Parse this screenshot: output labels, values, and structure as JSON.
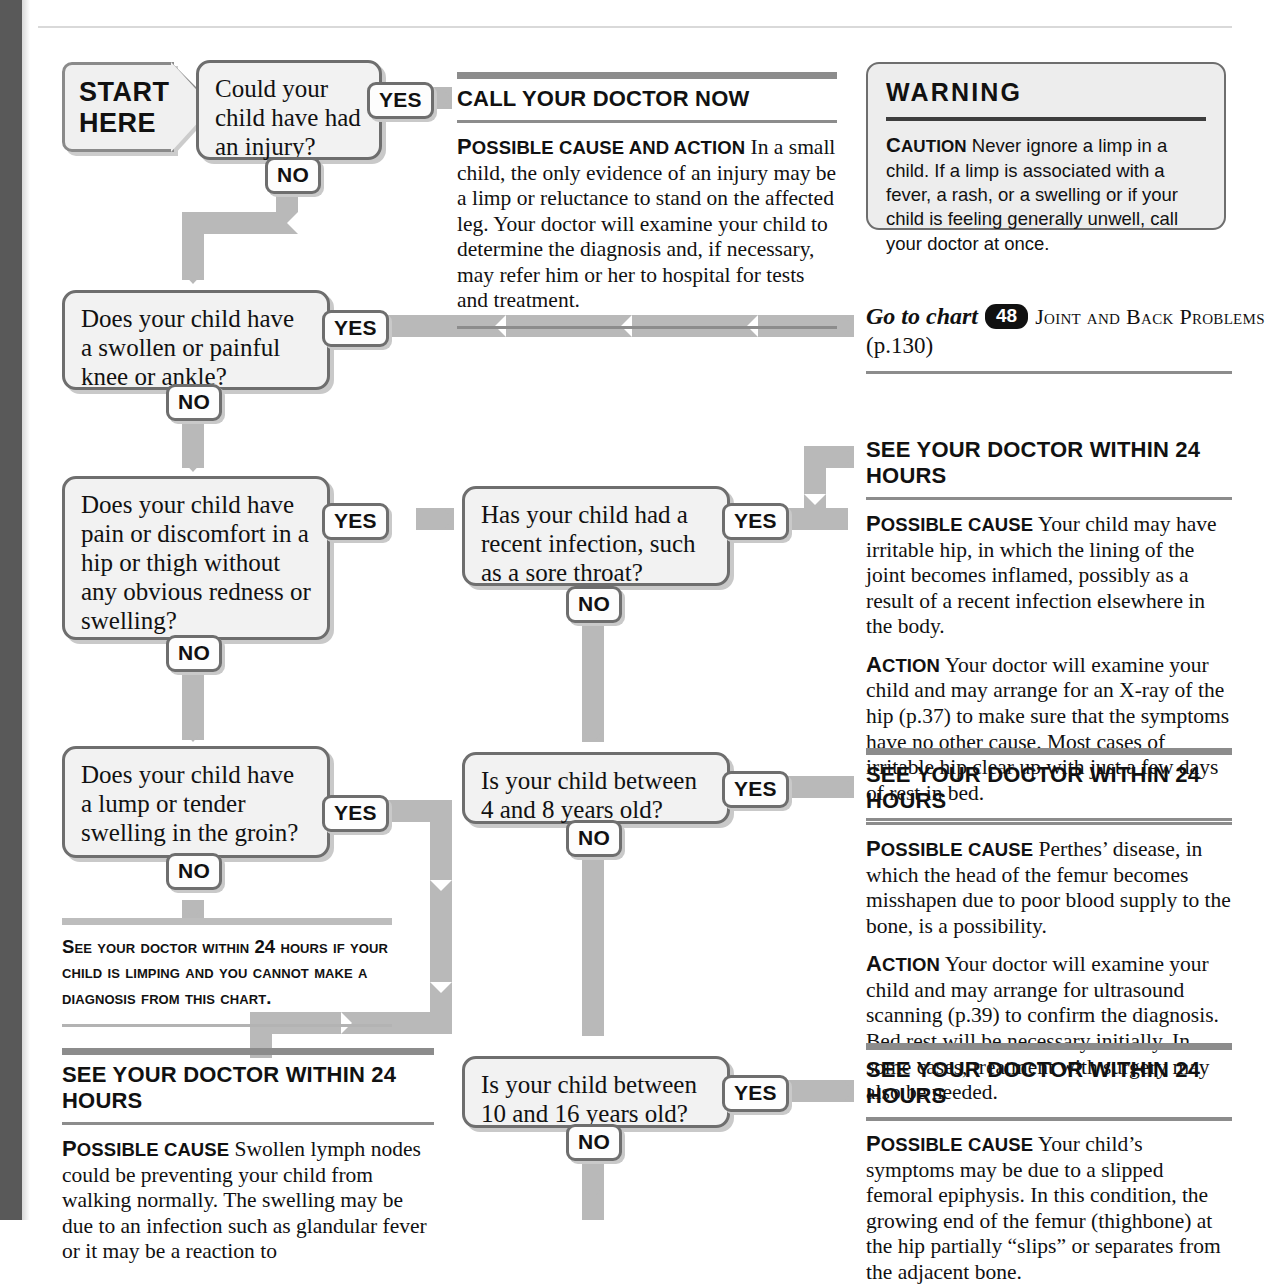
{
  "page": {
    "cut_text": "",
    "start_line1": "START",
    "start_line2": "HERE"
  },
  "labels": {
    "yes": "YES",
    "no": "NO"
  },
  "questions": [
    {
      "id": "injury",
      "text": "Could your child have had an injury?"
    },
    {
      "id": "knee",
      "text": "Does your child have a swollen or painful knee or ankle?"
    },
    {
      "id": "hip",
      "text": "Does your child have pain or discomfort in a hip or thigh without any obvious redness or swelling?"
    },
    {
      "id": "infection",
      "text": "Has your child had a recent infection, such as a sore throat?"
    },
    {
      "id": "groin",
      "text": "Does your child have a lump or tender swelling in the groin?"
    },
    {
      "id": "age4to8",
      "text": "Is your child between 4 and 8 years old?"
    },
    {
      "id": "age10to16",
      "text": "Is your child between 10 and 16 years old?"
    }
  ],
  "panels": {
    "call_doctor_now": {
      "heading": "CALL YOUR DOCTOR NOW",
      "paragraphs": [
        {
          "lead_cap": "P",
          "lead_rest": "OSSIBLE CAUSE AND ACTION",
          "body": " In a small child, the only evidence of an injury may be a limp or reluctance to stand on the affected leg. Your doctor will examine your child to determine the diagnosis and, if necessary, may refer him or her to hospital for tests and treatment."
        }
      ]
    },
    "irritable_hip": {
      "heading": "SEE YOUR DOCTOR WITHIN 24 HOURS",
      "paragraphs": [
        {
          "lead_cap": "P",
          "lead_rest": "OSSIBLE CAUSE",
          "body": " Your child may have irritable hip, in which the lining of the joint becomes inflamed, possibly as a result of a recent infection elsewhere in the body."
        },
        {
          "lead_cap": "A",
          "lead_rest": "CTION",
          "body": " Your doctor will examine your child and may arrange for an X-ray of the hip (p.37) to make sure that the symptoms have no other cause. Most cases of irritable hip clear up with just a few days of rest in bed."
        }
      ]
    },
    "perthes": {
      "heading": "SEE YOUR DOCTOR WITHIN 24 HOURS",
      "paragraphs": [
        {
          "lead_cap": "P",
          "lead_rest": "OSSIBLE CAUSE",
          "body": " Perthes’ disease, in which the head of the femur becomes misshapen due to poor blood supply to the bone, is a possibility."
        },
        {
          "lead_cap": "A",
          "lead_rest": "CTION",
          "body": " Your doctor will examine your child and may arrange for ultrasound scanning (p.39) to confirm the diagnosis. Bed rest will be necessary initially. In some cases, treatment with surgery may also be needed."
        }
      ]
    },
    "slipped_epiphysis": {
      "heading": "SEE YOUR DOCTOR WITHIN 24 HOURS",
      "paragraphs": [
        {
          "lead_cap": "P",
          "lead_rest": "OSSIBLE CAUSE",
          "body": " Your child’s symptoms may be due to a slipped femoral epiphysis. In this condition, the growing end of the femur (thighbone) at the hip partially “slips” or separates from the adjacent bone."
        }
      ]
    },
    "lymph_nodes": {
      "heading": "SEE YOUR DOCTOR WITHIN 24 HOURS",
      "paragraphs": [
        {
          "lead_cap": "P",
          "lead_rest": "OSSIBLE CAUSE",
          "body": " Swollen lymph nodes could be preventing your child from walking normally. The swelling may be due to an infection such as glandular fever or it may be a reaction to"
        }
      ]
    }
  },
  "warning": {
    "heading": "WARNING",
    "lead_cap": "C",
    "lead_rest": "AUTION",
    "body": " Never ignore a limp in a child. If a limp is associated with a fever, a rash, or a swelling or if your child is feeling generally unwell, call your doctor at once."
  },
  "goto_chart": {
    "prefix": "Go to chart",
    "number": "48",
    "chart_name": "Joint and Back Problems",
    "page_ref": "(p.130)"
  },
  "limp_note": {
    "text": "See your doctor within 24 hours if your child is limping and you cannot make a diagnosis from this chart."
  },
  "colors": {
    "connector": "#b9b9b9",
    "rule": "#8c8c8c",
    "box_border": "#6e6e6e",
    "box_fill": "#f2f2f2",
    "gutter": "#595959"
  }
}
